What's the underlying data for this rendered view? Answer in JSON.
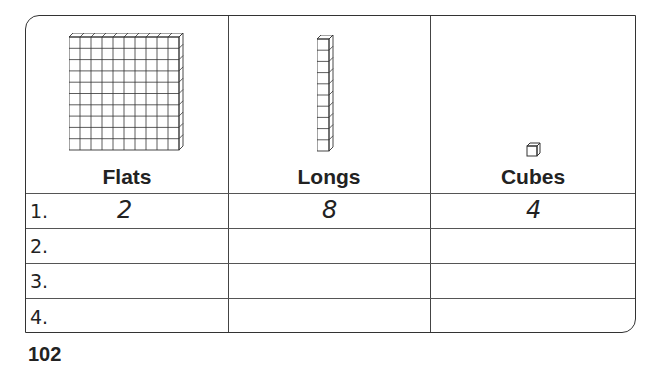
{
  "worksheet": {
    "columns": [
      {
        "label": "Flats",
        "icon": "flat-block-icon"
      },
      {
        "label": "Longs",
        "icon": "long-rod-icon"
      },
      {
        "label": "Cubes",
        "icon": "unit-cube-icon"
      }
    ],
    "rows": [
      {
        "number": "1.",
        "flats": "2",
        "longs": "8",
        "cubes": "4"
      },
      {
        "number": "2.",
        "flats": "",
        "longs": "",
        "cubes": ""
      },
      {
        "number": "3.",
        "flats": "",
        "longs": "",
        "cubes": ""
      },
      {
        "number": "4.",
        "flats": "",
        "longs": "",
        "cubes": ""
      }
    ]
  },
  "page": {
    "number": "102"
  }
}
